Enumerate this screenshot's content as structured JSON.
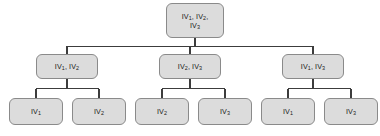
{
  "diagram": {
    "type": "tree",
    "background_color": "#ffffff",
    "node_fill_color": "#dcdcdc",
    "node_border_color": "#8a8a8a",
    "edge_color": "#3c3c3c",
    "text_color": "#1a1a1a",
    "levels": 3,
    "nodes": [
      {
        "id": "root",
        "level": 0,
        "label": "IV1, IV2, IV3",
        "label_parts": [
          {
            "base": "IV",
            "sub": "1",
            "sep": ", "
          },
          {
            "base": "IV",
            "sub": "2",
            "sep": ","
          },
          {
            "base": "IV",
            "sub": "3",
            "sep": ""
          }
        ],
        "x": 166,
        "y": 3,
        "w": 58,
        "h": 35
      },
      {
        "id": "m1",
        "level": 1,
        "label": "IV1, IV2",
        "label_parts": [
          {
            "base": "IV",
            "sub": "1",
            "sep": ", "
          },
          {
            "base": "IV",
            "sub": "2",
            "sep": ""
          }
        ],
        "x": 36,
        "y": 54,
        "w": 62,
        "h": 25
      },
      {
        "id": "m2",
        "level": 1,
        "label": "IV2, IV3",
        "label_parts": [
          {
            "base": "IV",
            "sub": "2",
            "sep": ", "
          },
          {
            "base": "IV",
            "sub": "3",
            "sep": ""
          }
        ],
        "x": 159,
        "y": 54,
        "w": 62,
        "h": 25
      },
      {
        "id": "m3",
        "level": 1,
        "label": "IV1, IV3",
        "label_parts": [
          {
            "base": "IV",
            "sub": "1",
            "sep": ", "
          },
          {
            "base": "IV",
            "sub": "3",
            "sep": ""
          }
        ],
        "x": 282,
        "y": 54,
        "w": 62,
        "h": 25
      },
      {
        "id": "l1",
        "level": 2,
        "label": "IV1",
        "label_parts": [
          {
            "base": "IV",
            "sub": "1",
            "sep": ""
          }
        ],
        "x": 9,
        "y": 98,
        "w": 54,
        "h": 27
      },
      {
        "id": "l2",
        "level": 2,
        "label": "IV2",
        "label_parts": [
          {
            "base": "IV",
            "sub": "2",
            "sep": ""
          }
        ],
        "x": 72,
        "y": 98,
        "w": 54,
        "h": 27
      },
      {
        "id": "l3",
        "level": 2,
        "label": "IV2",
        "label_parts": [
          {
            "base": "IV",
            "sub": "2",
            "sep": ""
          }
        ],
        "x": 135,
        "y": 98,
        "w": 54,
        "h": 27
      },
      {
        "id": "l4",
        "level": 2,
        "label": "IV3",
        "label_parts": [
          {
            "base": "IV",
            "sub": "3",
            "sep": ""
          }
        ],
        "x": 198,
        "y": 98,
        "w": 54,
        "h": 27
      },
      {
        "id": "l5",
        "level": 2,
        "label": "IV1",
        "label_parts": [
          {
            "base": "IV",
            "sub": "1",
            "sep": ""
          }
        ],
        "x": 261,
        "y": 98,
        "w": 54,
        "h": 27
      },
      {
        "id": "l6",
        "level": 2,
        "label": "IV3",
        "label_parts": [
          {
            "base": "IV",
            "sub": "3",
            "sep": ""
          }
        ],
        "x": 324,
        "y": 98,
        "w": 54,
        "h": 27
      }
    ],
    "edges": [
      {
        "from": "root",
        "to": "m1"
      },
      {
        "from": "root",
        "to": "m2"
      },
      {
        "from": "root",
        "to": "m3"
      },
      {
        "from": "m1",
        "to": "l1"
      },
      {
        "from": "m1",
        "to": "l2"
      },
      {
        "from": "m2",
        "to": "l3"
      },
      {
        "from": "m2",
        "to": "l4"
      },
      {
        "from": "m3",
        "to": "l5"
      },
      {
        "from": "m3",
        "to": "l6"
      }
    ]
  }
}
